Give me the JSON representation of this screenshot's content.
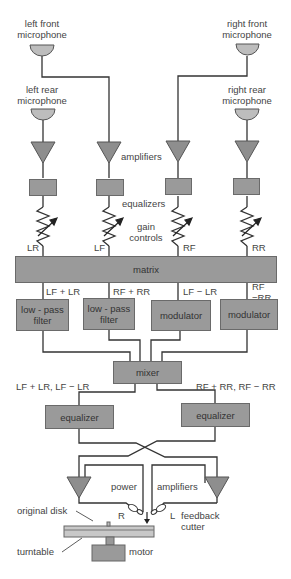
{
  "diagram": {
    "microphones": {
      "left_front": "left front\nmicrophone",
      "right_front": "right front\nmicrophone",
      "left_rear": "left rear\nmicrophone",
      "right_rear": "right rear\nmicrophone"
    },
    "labels": {
      "amplifiers": "amplifiers",
      "equalizers": "equalizers",
      "gain_controls": "gain\ncontrols",
      "ch_lr": "LR",
      "ch_lf": "LF",
      "ch_rf": "RF",
      "ch_rr": "RR",
      "sum_left": "LF + LR",
      "sum_right": "RF + RR",
      "diff_left": "LF − LR",
      "diff_right": "RF\n−RR",
      "left_bus": "LF + LR, LF − LR",
      "right_bus": "RF + RR, RF − RR",
      "power": "power",
      "power_amplifiers": "amplifiers",
      "r": "R",
      "l": "L",
      "feedback_cutter": "feedback\ncutter",
      "original_disk": "original disk",
      "turntable": "turntable",
      "motor": "motor"
    },
    "blocks": {
      "matrix": "matrix",
      "lpf1": "low - pass\nfilter",
      "lpf2": "low - pass\nfilter",
      "mod1": "modulator",
      "mod2": "modulator",
      "mixer": "mixer",
      "eq_left": "equalizer",
      "eq_right": "equalizer"
    },
    "colors": {
      "block_fill": "#9a9a9a",
      "line": "#333333",
      "mic_fill": "#bdbdbd"
    }
  }
}
